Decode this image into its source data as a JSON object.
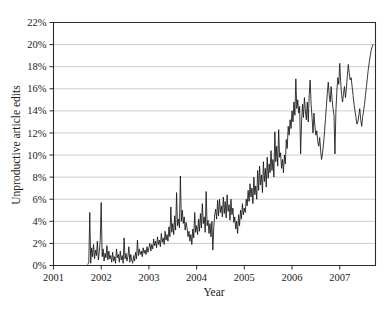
{
  "figure": {
    "background_color": "#ffffff",
    "line_color": "#151515",
    "grid_color": "#b8b8b8",
    "axis_color": "#2b2b2b"
  },
  "chart_data": {
    "type": "line",
    "title": "",
    "xlabel": "Year",
    "ylabel": "Unproductive article edits",
    "xlim": [
      2001.0,
      2007.75
    ],
    "ylim": [
      0,
      22
    ],
    "grid": true,
    "legend": false,
    "legend_position": "none",
    "x_tick_labels": [
      "2001",
      "2002",
      "2003",
      "2004",
      "2005",
      "2006",
      "2007"
    ],
    "x_ticks": [
      2001,
      2002,
      2003,
      2004,
      2005,
      2006,
      2007
    ],
    "y_tick_labels": [
      "0%",
      "2%",
      "4%",
      "6%",
      "8%",
      "10%",
      "12%",
      "14%",
      "16%",
      "18%",
      "20%",
      "22%"
    ],
    "y_ticks": [
      0,
      2,
      4,
      6,
      8,
      10,
      12,
      14,
      16,
      18,
      20,
      22
    ],
    "y_unit": "%",
    "series": [
      {
        "name": "Unproductive article edits",
        "x": [
          2001.72,
          2001.74,
          2001.76,
          2001.78,
          2001.8,
          2001.82,
          2001.84,
          2001.86,
          2001.88,
          2001.9,
          2001.92,
          2001.94,
          2001.96,
          2001.98,
          2002.0,
          2002.02,
          2002.04,
          2002.06,
          2002.08,
          2002.1,
          2002.12,
          2002.14,
          2002.16,
          2002.18,
          2002.2,
          2002.22,
          2002.24,
          2002.26,
          2002.28,
          2002.3,
          2002.32,
          2002.34,
          2002.36,
          2002.38,
          2002.4,
          2002.42,
          2002.44,
          2002.46,
          2002.48,
          2002.5,
          2002.52,
          2002.54,
          2002.56,
          2002.58,
          2002.6,
          2002.62,
          2002.64,
          2002.66,
          2002.68,
          2002.7,
          2002.72,
          2002.74,
          2002.76,
          2002.78,
          2002.8,
          2002.82,
          2002.84,
          2002.86,
          2002.88,
          2002.9,
          2002.92,
          2002.94,
          2002.96,
          2002.98,
          2003.0,
          2003.02,
          2003.04,
          2003.06,
          2003.08,
          2003.1,
          2003.12,
          2003.14,
          2003.16,
          2003.18,
          2003.2,
          2003.22,
          2003.24,
          2003.26,
          2003.28,
          2003.3,
          2003.32,
          2003.34,
          2003.36,
          2003.38,
          2003.4,
          2003.42,
          2003.44,
          2003.46,
          2003.48,
          2003.5,
          2003.52,
          2003.54,
          2003.56,
          2003.58,
          2003.6,
          2003.62,
          2003.64,
          2003.66,
          2003.68,
          2003.7,
          2003.72,
          2003.74,
          2003.76,
          2003.78,
          2003.8,
          2003.82,
          2003.84,
          2003.86,
          2003.88,
          2003.9,
          2003.92,
          2003.94,
          2003.96,
          2003.98,
          2004.0,
          2004.02,
          2004.04,
          2004.06,
          2004.08,
          2004.1,
          2004.12,
          2004.14,
          2004.16,
          2004.18,
          2004.2,
          2004.22,
          2004.24,
          2004.26,
          2004.28,
          2004.3,
          2004.32,
          2004.34,
          2004.36,
          2004.38,
          2004.4,
          2004.42,
          2004.44,
          2004.46,
          2004.48,
          2004.5,
          2004.52,
          2004.54,
          2004.56,
          2004.58,
          2004.6,
          2004.62,
          2004.64,
          2004.66,
          2004.68,
          2004.7,
          2004.72,
          2004.74,
          2004.76,
          2004.78,
          2004.8,
          2004.82,
          2004.84,
          2004.86,
          2004.88,
          2004.9,
          2004.92,
          2004.94,
          2004.96,
          2004.98,
          2005.0,
          2005.02,
          2005.04,
          2005.06,
          2005.08,
          2005.1,
          2005.12,
          2005.14,
          2005.16,
          2005.18,
          2005.2,
          2005.22,
          2005.24,
          2005.26,
          2005.28,
          2005.3,
          2005.32,
          2005.34,
          2005.36,
          2005.38,
          2005.4,
          2005.42,
          2005.44,
          2005.46,
          2005.48,
          2005.5,
          2005.52,
          2005.54,
          2005.56,
          2005.58,
          2005.6,
          2005.62,
          2005.64,
          2005.66,
          2005.68,
          2005.7,
          2005.72,
          2005.74,
          2005.76,
          2005.78,
          2005.8,
          2005.82,
          2005.84,
          2005.86,
          2005.88,
          2005.9,
          2005.92,
          2005.94,
          2005.96,
          2005.98,
          2006.0,
          2006.02,
          2006.04,
          2006.06,
          2006.08,
          2006.1,
          2006.12,
          2006.14,
          2006.16,
          2006.18,
          2006.2,
          2006.22,
          2006.24,
          2006.26,
          2006.28,
          2006.3,
          2006.32,
          2006.34,
          2006.36,
          2006.38,
          2006.4,
          2006.42,
          2006.44,
          2006.46,
          2006.48,
          2006.5,
          2006.52,
          2006.54,
          2006.56,
          2006.58,
          2006.6,
          2006.62,
          2006.64,
          2006.66,
          2006.68,
          2006.7,
          2006.72,
          2006.74,
          2006.76,
          2006.78,
          2006.8,
          2006.82,
          2006.84,
          2006.86,
          2006.88,
          2006.9,
          2006.92,
          2006.94,
          2006.96,
          2006.98,
          2007.0,
          2007.02,
          2007.04,
          2007.06,
          2007.08,
          2007.1,
          2007.12,
          2007.14,
          2007.16,
          2007.18,
          2007.2,
          2007.22,
          2007.24,
          2007.26,
          2007.28,
          2007.3,
          2007.32,
          2007.34,
          2007.36,
          2007.38,
          2007.4,
          2007.42,
          2007.44,
          2007.46,
          2007.48,
          2007.5,
          2007.52,
          2007.54,
          2007.56,
          2007.58,
          2007.6,
          2007.62,
          2007.64,
          2007.66,
          2007.68,
          2007.7
        ],
        "values": [
          0.1,
          0.3,
          4.8,
          0.2,
          1.6,
          0.8,
          1.9,
          0.6,
          1.4,
          0.9,
          2.2,
          0.5,
          1.2,
          2.3,
          5.7,
          0.8,
          1.5,
          0.4,
          1.1,
          0.7,
          1.8,
          0.5,
          1.3,
          0.6,
          0.9,
          0.3,
          1.2,
          0.4,
          0.8,
          0.2,
          1.5,
          0.7,
          1.0,
          0.3,
          1.3,
          0.5,
          0.9,
          0.2,
          2.5,
          0.6,
          1.1,
          0.4,
          0.8,
          1.7,
          0.3,
          1.0,
          0.5,
          0.2,
          0.9,
          0.4,
          1.2,
          0.6,
          2.3,
          0.9,
          1.5,
          1.0,
          1.3,
          0.8,
          1.6,
          1.1,
          1.4,
          1.0,
          1.7,
          1.2,
          1.6,
          2.0,
          1.3,
          1.9,
          1.5,
          2.4,
          1.8,
          2.2,
          1.6,
          2.6,
          1.9,
          2.3,
          1.7,
          2.9,
          2.1,
          2.5,
          1.9,
          3.1,
          2.3,
          2.8,
          2.2,
          3.5,
          2.6,
          5.3,
          3.0,
          3.8,
          2.8,
          4.5,
          3.2,
          6.6,
          3.6,
          4.2,
          3.4,
          8.1,
          4.0,
          5.0,
          3.8,
          4.4,
          3.2,
          3.9,
          3.4,
          2.6,
          3.1,
          2.2,
          2.8,
          1.9,
          3.3,
          2.5,
          4.8,
          3.0,
          3.6,
          2.8,
          4.2,
          3.1,
          4.7,
          3.4,
          5.6,
          3.8,
          4.4,
          3.0,
          6.7,
          3.6,
          4.1,
          2.9,
          3.8,
          2.6,
          4.0,
          1.4,
          3.5,
          4.6,
          5.1,
          4.2,
          5.9,
          4.5,
          6.0,
          4.8,
          5.4,
          4.4,
          6.2,
          4.7,
          5.8,
          4.3,
          6.4,
          4.9,
          5.5,
          4.1,
          6.0,
          4.6,
          5.2,
          3.9,
          4.4,
          3.3,
          4.0,
          2.9,
          4.6,
          3.6,
          5.0,
          4.2,
          5.6,
          4.6,
          5.2,
          4.8,
          6.0,
          5.4,
          6.8,
          5.8,
          7.4,
          6.2,
          7.0,
          5.6,
          8.0,
          6.4,
          7.2,
          6.0,
          8.6,
          6.8,
          9.0,
          7.3,
          8.2,
          6.6,
          9.4,
          7.6,
          8.8,
          7.1,
          9.8,
          7.9,
          9.2,
          8.4,
          10.4,
          8.6,
          9.6,
          8.0,
          12.1,
          9.4,
          10.8,
          9.0,
          12.3,
          9.8,
          10.2,
          8.8,
          9.6,
          8.4,
          10.0,
          9.2,
          11.4,
          10.6,
          12.6,
          11.8,
          13.2,
          12.4,
          14.0,
          13.0,
          14.8,
          13.6,
          16.9,
          14.2,
          15.0,
          13.8,
          14.4,
          10.1,
          13.0,
          14.6,
          13.4,
          15.2,
          14.0,
          13.2,
          14.8,
          13.0,
          15.4,
          16.8,
          14.6,
          13.4,
          12.0,
          13.8,
          12.6,
          11.8,
          12.2,
          11.2,
          10.8,
          11.6,
          10.4,
          9.6,
          10.2,
          11.0,
          12.0,
          13.2,
          14.4,
          15.6,
          16.6,
          15.4,
          14.8,
          16.2,
          15.0,
          14.2,
          13.6,
          10.1,
          14.0,
          15.8,
          17.0,
          16.4,
          18.3,
          16.6,
          15.4,
          14.8,
          15.6,
          16.2,
          15.2,
          16.0,
          17.2,
          18.2,
          17.4,
          16.8,
          17.0,
          16.2,
          15.4,
          14.6,
          14.0,
          13.4,
          12.8,
          13.0,
          13.6,
          14.2,
          13.2,
          12.6,
          13.4,
          14.0,
          14.6,
          15.4,
          16.2,
          17.0,
          17.8,
          18.4,
          19.0,
          19.5,
          19.8,
          20.0
        ]
      }
    ]
  }
}
